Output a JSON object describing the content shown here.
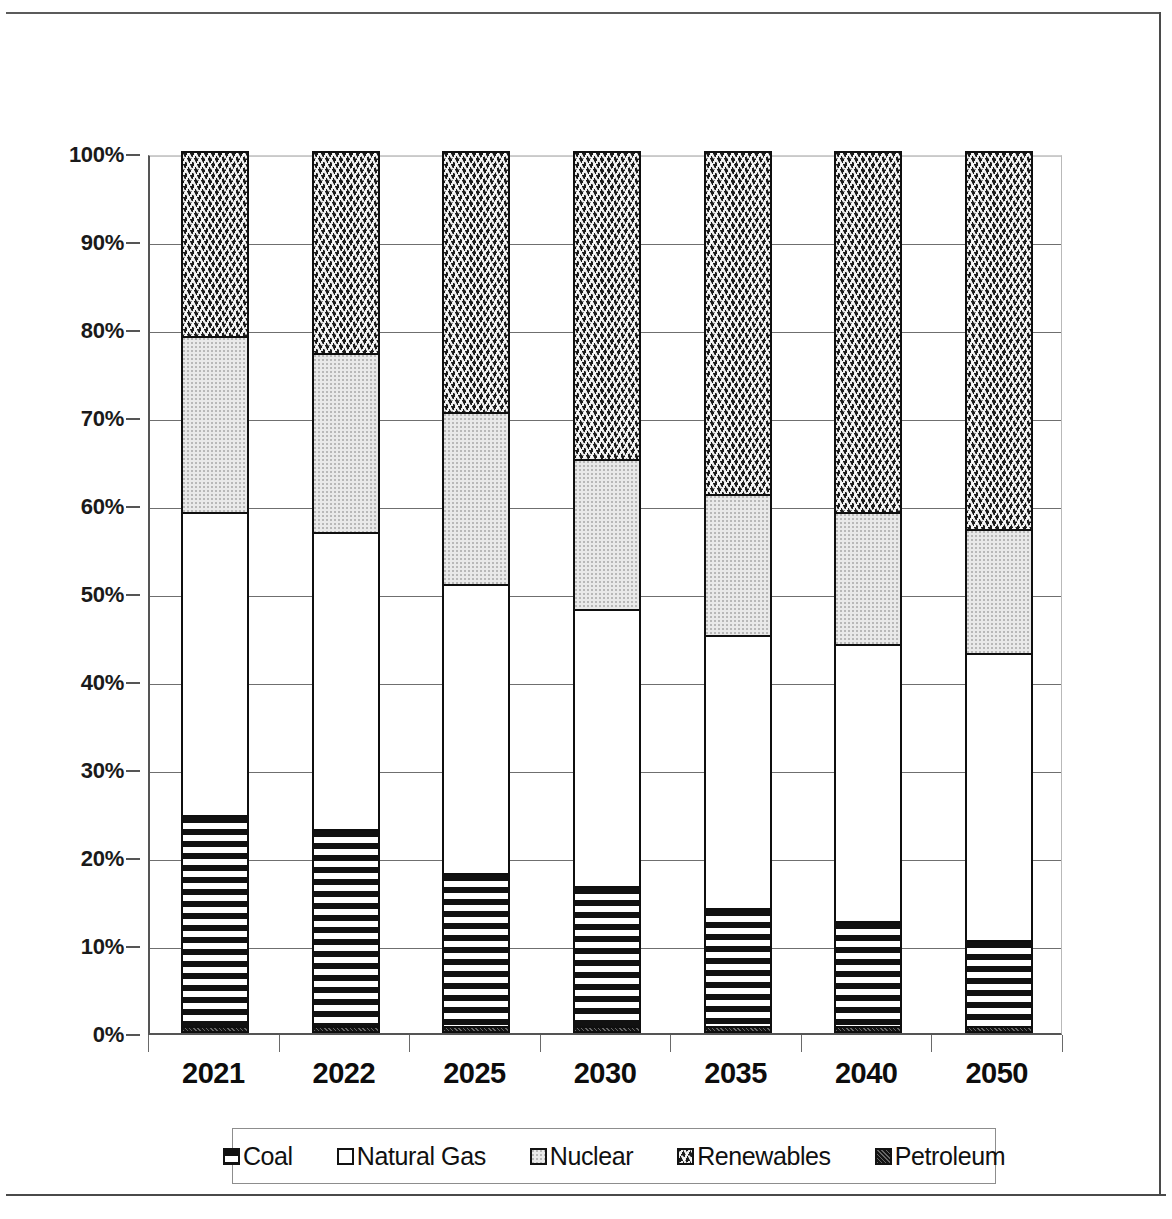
{
  "title": "",
  "legend": {
    "position": "bottom",
    "items": [
      {
        "label": "Coal",
        "pattern": "horizontal-lines",
        "color": "#111111"
      },
      {
        "label": "Natural Gas",
        "pattern": "solid-white",
        "color": "#ffffff"
      },
      {
        "label": "Nuclear",
        "pattern": "light-speckle",
        "color": "#e9e9e9"
      },
      {
        "label": "Renewables",
        "pattern": "wave-zigzag",
        "color": "#1b1b1b"
      },
      {
        "label": "Petroleum",
        "pattern": "dark-solid",
        "color": "#141414"
      }
    ]
  },
  "axes": {
    "y_ticks": [
      "0%",
      "10%",
      "20%",
      "30%",
      "40%",
      "50%",
      "60%",
      "70%",
      "80%",
      "90%",
      "100%"
    ],
    "x_ticks": [
      "2021",
      "2022",
      "2025",
      "2030",
      "2035",
      "2040",
      "2050"
    ]
  },
  "chart_data": {
    "type": "bar",
    "stacked": true,
    "normalized_100pct": true,
    "title": "",
    "subtitle": "",
    "xlabel": "",
    "ylabel": "",
    "ylim": [
      0,
      100
    ],
    "ytick_values": [
      0,
      10,
      20,
      30,
      40,
      50,
      60,
      70,
      80,
      90,
      100
    ],
    "ytick_labels": [
      "0%",
      "10%",
      "20%",
      "30%",
      "40%",
      "50%",
      "60%",
      "70%",
      "80%",
      "90%",
      "100%"
    ],
    "grid": true,
    "legend_position": "bottom",
    "categories": [
      "2021",
      "2022",
      "2025",
      "2030",
      "2035",
      "2040",
      "2050"
    ],
    "series": [
      {
        "name": "Petroleum",
        "values": [
          0.6,
          0.6,
          0.6,
          0.6,
          0.6,
          0.6,
          0.6
        ]
      },
      {
        "name": "Coal",
        "values": [
          23.9,
          22.4,
          17.4,
          15.9,
          13.4,
          11.9,
          9.7
        ]
      },
      {
        "name": "Natural Gas",
        "values": [
          34.5,
          33.7,
          32.8,
          31.5,
          31.0,
          31.5,
          32.7
        ]
      },
      {
        "name": "Nuclear",
        "values": [
          20.0,
          20.3,
          19.5,
          17.0,
          16.0,
          15.0,
          14.0
        ]
      },
      {
        "name": "Renewables",
        "values": [
          21.0,
          23.0,
          29.7,
          35.0,
          39.0,
          41.0,
          43.0
        ]
      }
    ],
    "cumulative_tops": {
      "2021": {
        "petroleum": 0.6,
        "coal": 24.5,
        "natural_gas": 59.0,
        "nuclear": 79.0,
        "renewables": 100.0
      },
      "2022": {
        "petroleum": 0.6,
        "coal": 23.0,
        "natural_gas": 56.7,
        "nuclear": 77.0,
        "renewables": 100.0
      },
      "2025": {
        "petroleum": 0.6,
        "coal": 18.0,
        "natural_gas": 50.8,
        "nuclear": 70.3,
        "renewables": 100.0
      },
      "2030": {
        "petroleum": 0.6,
        "coal": 16.5,
        "natural_gas": 48.0,
        "nuclear": 65.0,
        "renewables": 100.0
      },
      "2035": {
        "petroleum": 0.6,
        "coal": 14.0,
        "natural_gas": 45.0,
        "nuclear": 61.0,
        "renewables": 100.0
      },
      "2040": {
        "petroleum": 0.6,
        "coal": 12.5,
        "natural_gas": 44.0,
        "nuclear": 59.0,
        "renewables": 100.0
      },
      "2050": {
        "petroleum": 0.6,
        "coal": 10.3,
        "natural_gas": 43.0,
        "nuclear": 57.0,
        "renewables": 100.0
      }
    }
  }
}
